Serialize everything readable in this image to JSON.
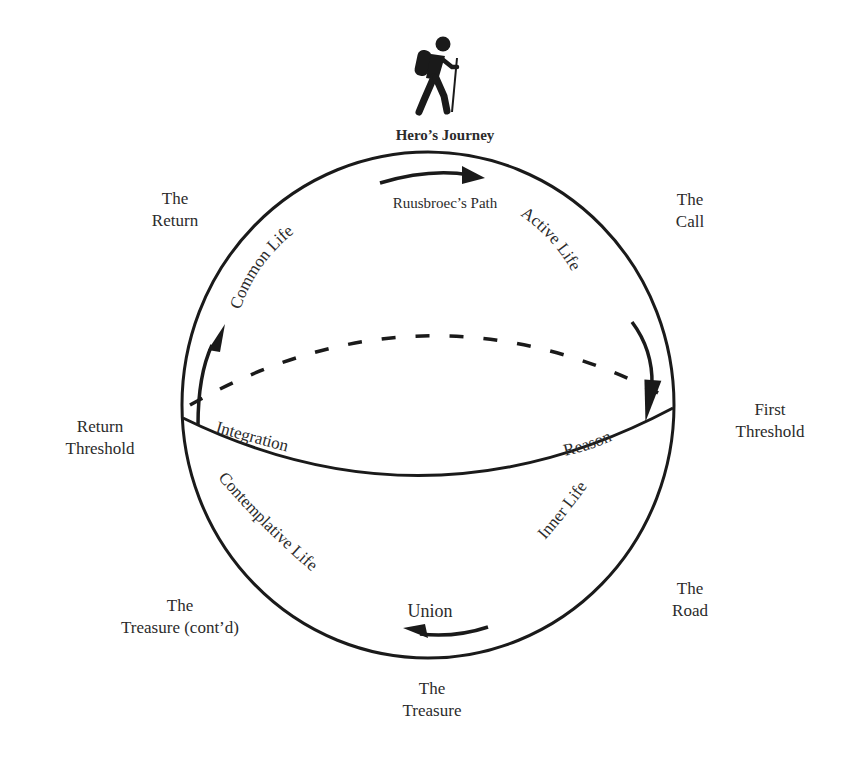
{
  "header": {
    "icon": "hiker-icon",
    "title": "Hero’s Journey",
    "subtitle": "Ruusbroec’s Path"
  },
  "stages": {
    "the_call": [
      "The",
      "Call"
    ],
    "first_threshold": [
      "First",
      "Threshold"
    ],
    "the_road": [
      "The",
      "Road"
    ],
    "the_treasure": [
      "The",
      "Treasure"
    ],
    "the_treasure_contd": [
      "The",
      "Treasure (cont’d)"
    ],
    "return_threshold": [
      "Return",
      "Threshold"
    ],
    "the_return": [
      "The",
      "Return"
    ]
  },
  "path_labels": {
    "active_life": "Active Life",
    "reason": "Reason",
    "inner_life": "Inner Life",
    "union": "Union",
    "contemplative_life": "Contemplative Life",
    "integration": "Integration",
    "common_life": "Common Life"
  },
  "colors": {
    "stroke": "#1a1a1a",
    "text": "#2b2b2b",
    "background": "#ffffff"
  }
}
